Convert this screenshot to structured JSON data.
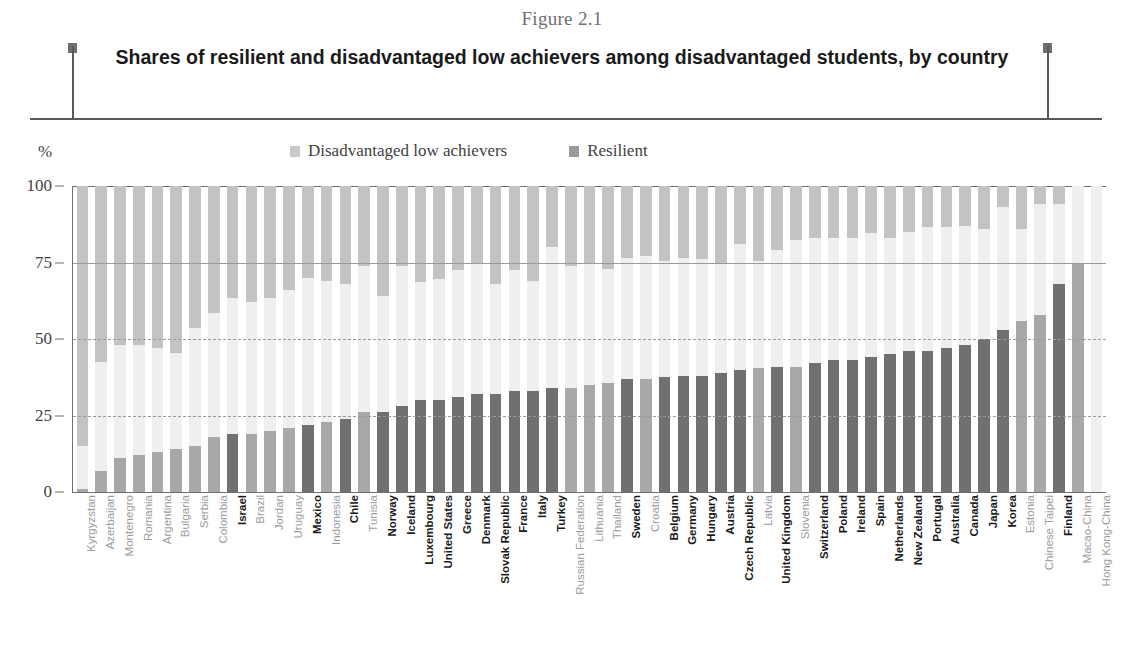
{
  "header": {
    "figure_number": "Figure 2.1",
    "title": "Shares of resilient and disadvantaged low achievers among disadvantaged students, by country"
  },
  "axis": {
    "unit_label": "%",
    "y_ticks": [
      "0",
      "25",
      "50",
      "75",
      "100"
    ]
  },
  "legend": {
    "items": [
      {
        "label": "Disadvantaged low achievers",
        "color": "#c9c9c9",
        "swatch_name": "legend-swatch-disadvantaged"
      },
      {
        "label": "Resilient",
        "color": "#9a9a9a",
        "swatch_name": "legend-swatch-resilient"
      }
    ]
  },
  "colors": {
    "resilient_oecd": "#6f7072",
    "resilient_partner": "#a8a8a8",
    "low_achievers": "#c3c3c3",
    "bar_middle": "#efefef",
    "axis": "#6d6e71",
    "grid": "#9a9a9a"
  },
  "chart_data": {
    "type": "bar",
    "title": "Shares of resilient and disadvantaged low achievers among disadvantaged students, by country",
    "subtitle": "Figure 2.1",
    "xlabel": "",
    "ylabel": "%",
    "ylim": [
      0,
      100
    ],
    "yticks": [
      0,
      25,
      50,
      75,
      100
    ],
    "grid": true,
    "legend_position": "top",
    "stacked": "floating-ends",
    "note": "Each bar shows the resilient share measured from 0 at the bottom, and the disadvantaged low achievers share measured from 100 at the top.",
    "series": [
      {
        "name": "Resilient",
        "key": "resilient"
      },
      {
        "name": "Disadvantaged low achievers",
        "key": "low_achievers"
      }
    ],
    "categories": [
      "Kyrgyzstan",
      "Azerbaijan",
      "Montenegro",
      "Romania",
      "Argentina",
      "Bulgaria",
      "Serbia",
      "Colombia",
      "Israel",
      "Brazil",
      "Jordan",
      "Uruguay",
      "Mexico",
      "Indonesia",
      "Chile",
      "Tunisia",
      "Norway",
      "Iceland",
      "Luxembourg",
      "United States",
      "Greece",
      "Denmark",
      "Slovak Republic",
      "France",
      "Italy",
      "Turkey",
      "Russian Federation",
      "Lithuania",
      "Thailand",
      "Sweden",
      "Croatia",
      "Belgium",
      "Germany",
      "Hungary",
      "Austria",
      "Czech Republic",
      "Latvia",
      "United Kingdom",
      "Slovenia",
      "Switzerland",
      "Poland",
      "Ireland",
      "Spain",
      "Netherlands",
      "New Zealand",
      "Portugal",
      "Australia",
      "Canada",
      "Japan",
      "Korea",
      "Estonia",
      "Chinese Taipei",
      "Finland",
      "Macao-China",
      "Hong Kong-China"
    ],
    "group": [
      "partner",
      "partner",
      "partner",
      "partner",
      "partner",
      "partner",
      "partner",
      "partner",
      "oecd",
      "partner",
      "partner",
      "partner",
      "oecd",
      "partner",
      "oecd",
      "partner",
      "oecd",
      "oecd",
      "oecd",
      "oecd",
      "oecd",
      "oecd",
      "oecd",
      "oecd",
      "oecd",
      "oecd",
      "partner",
      "partner",
      "partner",
      "oecd",
      "partner",
      "oecd",
      "oecd",
      "oecd",
      "oecd",
      "oecd",
      "partner",
      "oecd",
      "partner",
      "oecd",
      "oecd",
      "oecd",
      "oecd",
      "oecd",
      "oecd",
      "oecd",
      "oecd",
      "oecd",
      "oecd",
      "oecd",
      "partner",
      "partner",
      "oecd",
      "partner",
      "partner"
    ],
    "resilient": [
      1,
      7,
      11,
      12,
      13,
      14,
      15,
      18,
      19,
      19,
      20,
      21,
      22,
      23,
      24,
      26,
      26,
      28,
      30,
      30,
      31,
      32,
      32,
      33,
      33,
      34,
      34,
      35,
      35.5,
      37,
      37,
      37.5,
      38,
      38,
      39,
      40,
      40.5,
      41,
      41,
      42,
      43,
      43,
      44,
      45,
      46,
      46,
      47,
      48,
      50,
      53,
      56,
      58,
      68,
      75
    ],
    "low_achievers": [
      85,
      57.5,
      52,
      52,
      53,
      54.5,
      46.5,
      41.5,
      36.5,
      38,
      36.5,
      34,
      30,
      31,
      32,
      26,
      36,
      26,
      31.5,
      30.5,
      27.5,
      25.5,
      32,
      27.5,
      31,
      20,
      26,
      25.5,
      27,
      23.5,
      23,
      24.5,
      23.5,
      24,
      25,
      19,
      24.5,
      21,
      17.5,
      17,
      17,
      17,
      15.5,
      17,
      15,
      13.5,
      13.5,
      13,
      14,
      7,
      14,
      6,
      6
    ],
    "resilient_full": [
      1,
      7,
      11,
      12,
      13,
      14,
      15,
      18,
      19,
      19,
      20,
      21,
      22,
      23,
      24,
      26,
      26,
      28,
      30,
      30,
      31,
      32,
      32,
      33,
      33,
      34,
      34,
      35,
      35.5,
      37,
      37,
      37.5,
      38,
      38,
      39,
      40,
      40.5,
      41,
      41,
      42,
      43,
      43,
      44,
      45,
      46,
      46,
      47,
      48,
      50,
      53,
      56,
      58,
      68,
      75
    ]
  }
}
